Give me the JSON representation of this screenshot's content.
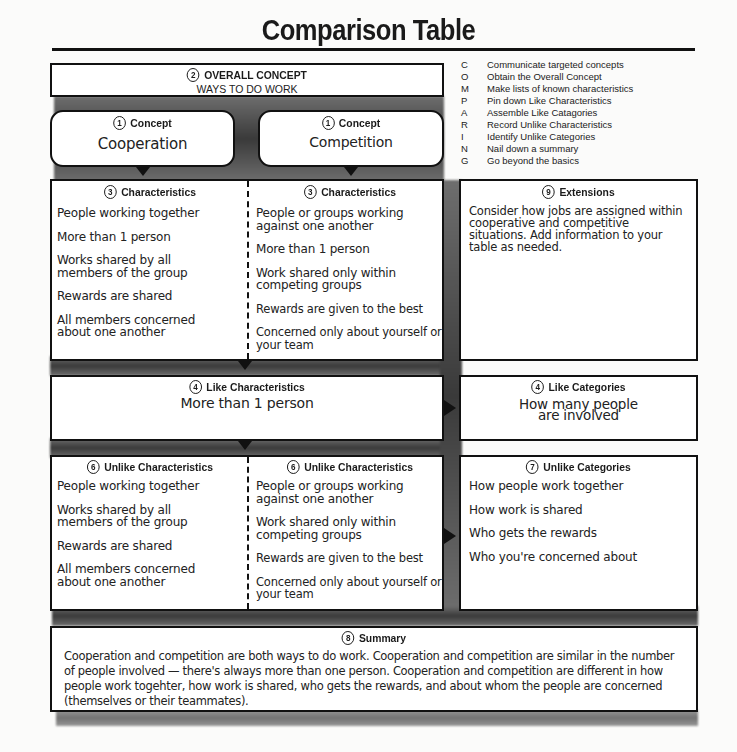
{
  "title": "Comparison Table",
  "overall_concept": {
    "number": "2",
    "label": "OVERALL CONCEPT",
    "value": "WAYS TO DO WORK"
  },
  "concepts": [
    {
      "number": "1",
      "label": "Concept",
      "value": "Cooperation"
    },
    {
      "number": "1",
      "label": "Concept",
      "value": "Competition"
    }
  ],
  "legend": [
    {
      "letter": "C",
      "text": "Communicate targeted concepts"
    },
    {
      "letter": "O",
      "text": "Obtain the Overall Concept"
    },
    {
      "letter": "M",
      "text": "Make lists of known characteristics"
    },
    {
      "letter": "P",
      "text": "Pin down Like Characteristics"
    },
    {
      "letter": "A",
      "text": "Assemble Like Catagories"
    },
    {
      "letter": "R",
      "text": "Record Unlike Characteristics"
    },
    {
      "letter": "I",
      "text": "Identify Unlike Categories"
    },
    {
      "letter": "N",
      "text": "Nail down a summary"
    },
    {
      "letter": "G",
      "text": "Go beyond the basics"
    }
  ],
  "characteristics": {
    "number": "3",
    "label": "Characteristics",
    "left": [
      "People working together",
      "More than 1 person",
      "Works shared by all members of the group",
      "Rewards are shared",
      "All members concerned about one another"
    ],
    "right": [
      "People or groups working against one another",
      "More than 1 person",
      "Work shared only within competing groups",
      "Rewards are given to the best",
      "Concerned only about yourself or your team"
    ]
  },
  "extensions": {
    "number": "9",
    "label": "Extensions",
    "text": "Consider how jobs are assigned within cooperative and competitive situations. Add information to your table as needed."
  },
  "like_characteristics": {
    "number": "4",
    "label": "Like Characteristics",
    "value": "More than 1 person"
  },
  "like_categories": {
    "number": "4",
    "label": "Like Categories",
    "value": "How many people are involved"
  },
  "unlike_characteristics": {
    "number": "6",
    "label": "Unlike Characteristics",
    "left": [
      "People working together",
      "Works shared by all members of the group",
      "Rewards are shared",
      "All members concerned about one another"
    ],
    "right": [
      "People or groups working against one another",
      "Work shared only within competing groups",
      "Rewards are given to the best",
      "Concerned only about yourself or your team"
    ]
  },
  "unlike_categories": {
    "number": "7",
    "label": "Unlike Categories",
    "items": [
      "How people work together",
      "How work is shared",
      "Who gets the rewards",
      "Who you're concerned about"
    ]
  },
  "summary": {
    "number": "8",
    "label": "Summary",
    "text": "Cooperation and competition are both ways to do work. Cooperation and competition are similar in the number of people involved — there's always more than one person. Cooperation and competition are different in how people work togehter, how work is shared, who gets the rewards, and about whom the people are concerned (themselves or their teammates)."
  }
}
